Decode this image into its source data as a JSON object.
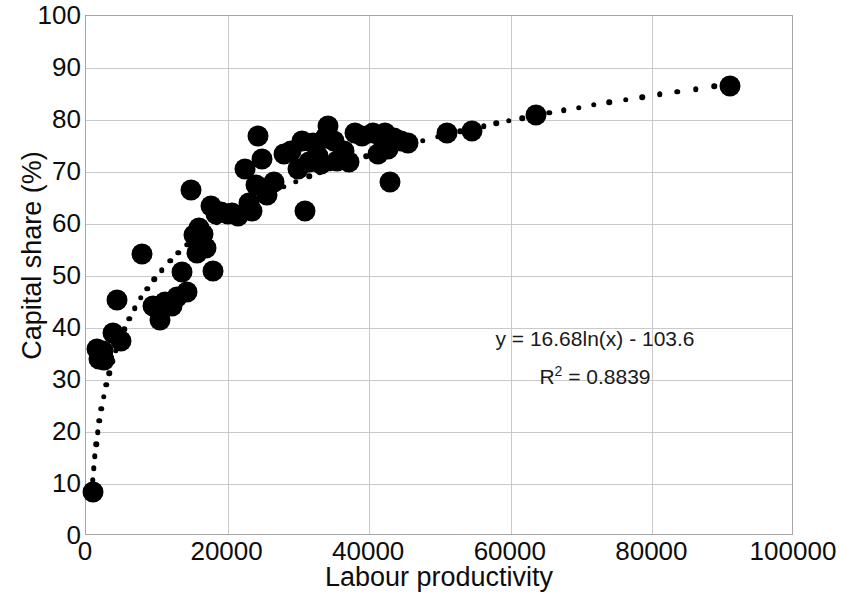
{
  "chart_data": {
    "type": "scatter",
    "title": "",
    "xlabel": "Labour productivity",
    "ylabel": "Capital share (%)",
    "xlim": [
      0,
      100000
    ],
    "ylim": [
      0,
      100
    ],
    "xticks": [
      "0",
      "20000",
      "40000",
      "60000",
      "80000",
      "100000"
    ],
    "xtick_values": [
      0,
      20000,
      40000,
      60000,
      80000,
      100000
    ],
    "yticks": [
      "0",
      "10",
      "20",
      "30",
      "40",
      "50",
      "60",
      "70",
      "80",
      "90",
      "100"
    ],
    "ytick_values": [
      0,
      10,
      20,
      30,
      40,
      50,
      60,
      70,
      80,
      90,
      100
    ],
    "grid": true,
    "legend": "none",
    "marker_color": "#000000",
    "gridline_color": "#c9c9c9",
    "axis_color": "#a6a6a6",
    "annotations": {
      "equation": "y = 16.68ln(x) - 103.6",
      "r_squared_prefix": "R",
      "r_squared_exponent": "2",
      "r_squared_value": " = 0.8839"
    },
    "trendline": {
      "type": "logarithmic",
      "style": "dotted",
      "coefficient": 16.68,
      "intercept": -103.6,
      "r_squared": 0.8839,
      "x_start": 950,
      "x_end": 91500
    },
    "points": [
      {
        "x": 1000,
        "y": 8.5
      },
      {
        "x": 1600,
        "y": 36.0
      },
      {
        "x": 1900,
        "y": 34.0
      },
      {
        "x": 2400,
        "y": 35.5
      },
      {
        "x": 2600,
        "y": 33.8
      },
      {
        "x": 3800,
        "y": 39.0
      },
      {
        "x": 4400,
        "y": 45.3
      },
      {
        "x": 5000,
        "y": 37.5
      },
      {
        "x": 7900,
        "y": 54.3
      },
      {
        "x": 9500,
        "y": 44.2
      },
      {
        "x": 10500,
        "y": 41.5
      },
      {
        "x": 11200,
        "y": 45.0
      },
      {
        "x": 12200,
        "y": 44.3
      },
      {
        "x": 12800,
        "y": 46.0
      },
      {
        "x": 13500,
        "y": 50.8
      },
      {
        "x": 14200,
        "y": 47.0
      },
      {
        "x": 14800,
        "y": 66.5
      },
      {
        "x": 15200,
        "y": 57.8
      },
      {
        "x": 15700,
        "y": 54.5
      },
      {
        "x": 16000,
        "y": 59.3
      },
      {
        "x": 16500,
        "y": 58.0
      },
      {
        "x": 17000,
        "y": 55.3
      },
      {
        "x": 17600,
        "y": 63.5
      },
      {
        "x": 18000,
        "y": 51.0
      },
      {
        "x": 18400,
        "y": 62.0
      },
      {
        "x": 19000,
        "y": 62.3
      },
      {
        "x": 20000,
        "y": 62.0
      },
      {
        "x": 20600,
        "y": 62.2
      },
      {
        "x": 21500,
        "y": 61.5
      },
      {
        "x": 22500,
        "y": 70.5
      },
      {
        "x": 23000,
        "y": 64.0
      },
      {
        "x": 23500,
        "y": 62.5
      },
      {
        "x": 24000,
        "y": 67.5
      },
      {
        "x": 24300,
        "y": 77.0
      },
      {
        "x": 24800,
        "y": 72.5
      },
      {
        "x": 25500,
        "y": 65.5
      },
      {
        "x": 26500,
        "y": 68.0
      },
      {
        "x": 28000,
        "y": 73.5
      },
      {
        "x": 29000,
        "y": 74.0
      },
      {
        "x": 30000,
        "y": 70.5
      },
      {
        "x": 30500,
        "y": 76.0
      },
      {
        "x": 31000,
        "y": 62.5
      },
      {
        "x": 31500,
        "y": 72.0
      },
      {
        "x": 32000,
        "y": 75.5
      },
      {
        "x": 32800,
        "y": 73.0
      },
      {
        "x": 33200,
        "y": 71.5
      },
      {
        "x": 33800,
        "y": 76.5
      },
      {
        "x": 34200,
        "y": 78.8
      },
      {
        "x": 35000,
        "y": 76.0
      },
      {
        "x": 35500,
        "y": 72.2
      },
      {
        "x": 36500,
        "y": 74.0
      },
      {
        "x": 37200,
        "y": 72.0
      },
      {
        "x": 38000,
        "y": 77.5
      },
      {
        "x": 39000,
        "y": 77.0
      },
      {
        "x": 40500,
        "y": 77.5
      },
      {
        "x": 41200,
        "y": 73.5
      },
      {
        "x": 41800,
        "y": 76.5
      },
      {
        "x": 42200,
        "y": 77.5
      },
      {
        "x": 42600,
        "y": 74.5
      },
      {
        "x": 42900,
        "y": 68.0
      },
      {
        "x": 43500,
        "y": 76.5
      },
      {
        "x": 44500,
        "y": 76.0
      },
      {
        "x": 45500,
        "y": 75.5
      },
      {
        "x": 51000,
        "y": 77.5
      },
      {
        "x": 54500,
        "y": 77.8
      },
      {
        "x": 63500,
        "y": 81.0
      },
      {
        "x": 91000,
        "y": 86.5
      }
    ]
  }
}
